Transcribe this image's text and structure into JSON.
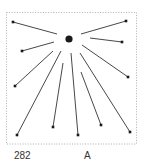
{
  "figure": {
    "number": "282",
    "label": "A",
    "colors": {
      "line": "#333333",
      "border": "#9a9a9a",
      "dot": "#1a1a1a"
    },
    "frame": {
      "x": 6.5,
      "y": 12.5,
      "width": 130,
      "height": 131.5
    },
    "center": {
      "x": 69,
      "y": 39,
      "r": 3.6
    },
    "rays": [
      {
        "x1": 13,
        "y1": 22,
        "x2": 57,
        "y2": 34
      },
      {
        "x1": 22,
        "y1": 51,
        "x2": 54,
        "y2": 42
      },
      {
        "x1": 15,
        "y1": 86,
        "x2": 53,
        "y2": 51
      },
      {
        "x1": 17,
        "y1": 135,
        "x2": 61,
        "y2": 51
      },
      {
        "x1": 53,
        "y1": 127,
        "x2": 63,
        "y2": 63
      },
      {
        "x1": 78,
        "y1": 135,
        "x2": 71,
        "y2": 53
      },
      {
        "x1": 101,
        "y1": 125,
        "x2": 81,
        "y2": 72
      },
      {
        "x1": 130,
        "y1": 132,
        "x2": 80,
        "y2": 53
      },
      {
        "x1": 128,
        "y1": 77,
        "x2": 82,
        "y2": 45
      },
      {
        "x1": 122,
        "y1": 42,
        "x2": 90,
        "y2": 38
      },
      {
        "x1": 126,
        "y1": 21,
        "x2": 81,
        "y2": 34
      }
    ]
  }
}
